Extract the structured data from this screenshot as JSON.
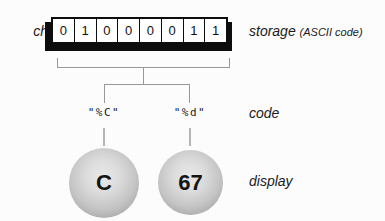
{
  "storage_row": {
    "variable_label": "ch",
    "bits": [
      "0",
      "1",
      "0",
      "0",
      "0",
      "0",
      "1",
      "1"
    ],
    "label": "storage",
    "label_note": "(ASCII code)"
  },
  "code_row": {
    "left_code": "\"%C\"",
    "right_code": "\"%d\"",
    "label": "code"
  },
  "display_row": {
    "left_value": "C",
    "right_value": "67",
    "label": "display"
  },
  "colors": {
    "background": "#fcfcfc",
    "box_border": "#0d0d0d",
    "bracket_line": "#999999",
    "dash_line": "#b5b5b5",
    "ball_fill_center": "#e9e9e9",
    "ball_fill_edge": "#999999"
  }
}
